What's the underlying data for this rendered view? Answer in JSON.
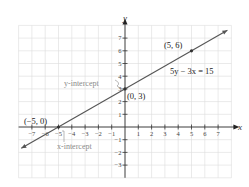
{
  "chart_data": {
    "type": "line",
    "title": "",
    "xlabel": "x",
    "ylabel": "y",
    "xlim": [
      -8,
      8
    ],
    "ylim": [
      -4,
      8
    ],
    "grid": true,
    "x_ticks": [
      -7,
      -6,
      -5,
      -4,
      -3,
      -2,
      -1,
      1,
      2,
      3,
      4,
      5,
      6,
      7
    ],
    "y_ticks": [
      -3,
      -2,
      -1,
      1,
      2,
      3,
      4,
      5,
      6,
      7
    ],
    "x_tick_labels": [
      "−7",
      "−6",
      "−5",
      "−4",
      "−3",
      "−2",
      "−1",
      "1",
      "2",
      "3",
      "4",
      "5",
      "6",
      "7"
    ],
    "y_tick_labels": [
      "−3",
      "−2",
      "−1",
      "1",
      "2",
      "3",
      "4",
      "5",
      "6",
      "7"
    ],
    "series": [
      {
        "name": "5y − 3x = 15",
        "equation": "5y - 3x = 15",
        "slope": 0.6,
        "intercept": 3,
        "x": [
          -7.8,
          7.7
        ],
        "y": [
          -1.68,
          7.62
        ],
        "arrows": "both"
      }
    ],
    "points": [
      {
        "x": -5,
        "y": 0,
        "label": "(−5, 0)"
      },
      {
        "x": 0,
        "y": 3,
        "label": "(0, 3)"
      },
      {
        "x": 5,
        "y": 6,
        "label": "(5, 6)"
      }
    ],
    "annotations": [
      {
        "text": "y-intercept",
        "points_to": [
          0,
          3
        ]
      },
      {
        "text": "x-intercept",
        "points_to": [
          -5,
          0
        ]
      },
      {
        "text": "5y − 3x = 15",
        "near": [
          5.5,
          4.5
        ]
      }
    ]
  },
  "labels": {
    "x_axis": "x",
    "y_axis": "y",
    "equation": "5y − 3x = 15",
    "pt_a": "(−5, 0)",
    "pt_b": "(0, 3)",
    "pt_c": "(5, 6)",
    "y_intercept": "y-intercept",
    "x_intercept": "x-intercept"
  }
}
